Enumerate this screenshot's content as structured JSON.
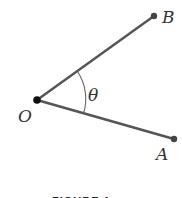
{
  "diagram": {
    "type": "angle",
    "points": {
      "O": {
        "label": "O",
        "x": 37,
        "y": 100
      },
      "A": {
        "label": "A",
        "x": 174,
        "y": 139
      },
      "B": {
        "label": "B",
        "x": 154,
        "y": 16
      }
    },
    "rays": [
      {
        "from": "O",
        "to": "B"
      },
      {
        "from": "O",
        "to": "A"
      }
    ],
    "angle": {
      "label": "θ",
      "vertex": "O",
      "between": [
        "A",
        "B"
      ]
    },
    "caption": "FIGURE 1"
  },
  "colors": {
    "line": "#555555",
    "point": "#444444",
    "vertex": "#111111",
    "label": "#333333"
  }
}
